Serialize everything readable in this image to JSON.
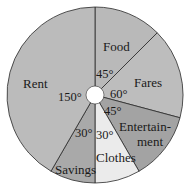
{
  "chart_data": {
    "type": "pie",
    "title": "",
    "unit": "degrees",
    "start_angle": "12 o'clock",
    "direction": "clockwise",
    "categories": [
      "Food",
      "Fares",
      "Entertainment",
      "Clothes",
      "Savings",
      "Rent"
    ],
    "values": [
      45,
      60,
      45,
      30,
      30,
      150
    ],
    "value_labels": [
      "45°",
      "60°",
      "45°",
      "30°",
      "30°",
      "150°"
    ],
    "colors": [
      "#b9b9b9",
      "#bdbdbd",
      "#a3a3a3",
      "#ebebeb",
      "#a9a9a9",
      "#bbbbbb"
    ]
  },
  "labels": {
    "food": "Food",
    "fares": "Fares",
    "entertainment_line1": "Entertain-",
    "entertainment_line2": "ment",
    "clothes": "Clothes",
    "savings": "Savings",
    "rent": "Rent"
  },
  "angles": {
    "food": "45°",
    "fares": "60°",
    "entertainment": "45°",
    "clothes": "30°",
    "savings": "30°",
    "rent": "150°"
  }
}
